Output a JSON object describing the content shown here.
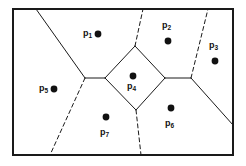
{
  "figure": {
    "kind": "voronoi-diagram",
    "caption": "",
    "frame": {
      "x": 13,
      "y": 9,
      "width": 220,
      "height": 146,
      "stroke_color": "#1a1a1a",
      "stroke_width": 2
    },
    "style": {
      "solid_edge_color": "#1a1a1a",
      "dashed_edge_color": "#1a1a1a",
      "solid_edge_width": 1,
      "dashed_edge_width": 1,
      "dash_pattern": "4 3",
      "site_dot_color": "#111111",
      "site_dot_radius": 3.4,
      "label_color": "#111111",
      "background_color": "#ffffff"
    }
  },
  "chart_data": {
    "type": "scatter",
    "title": "",
    "xlabel": "",
    "ylabel": "",
    "xlim": [
      13,
      233
    ],
    "ylim": [
      9,
      155
    ],
    "grid": false,
    "legend": null,
    "sites": [
      {
        "id": "p1",
        "label": "p",
        "subscript": "1",
        "dot_x": 98,
        "dot_y": 34,
        "label_x": 83,
        "label_y": 29,
        "label_pos": "left"
      },
      {
        "id": "p2",
        "label": "p",
        "subscript": "2",
        "dot_x": 168,
        "dot_y": 41,
        "label_x": 162,
        "label_y": 21,
        "label_pos": "above"
      },
      {
        "id": "p3",
        "label": "p",
        "subscript": "3",
        "dot_x": 215,
        "dot_y": 61,
        "label_x": 209,
        "label_y": 41,
        "label_pos": "above"
      },
      {
        "id": "p4",
        "label": "p",
        "subscript": "4",
        "dot_x": 133,
        "dot_y": 76,
        "label_x": 127,
        "label_y": 82,
        "label_pos": "below"
      },
      {
        "id": "p5",
        "label": "p",
        "subscript": "5",
        "dot_x": 54,
        "dot_y": 89,
        "label_x": 39,
        "label_y": 84,
        "label_pos": "left"
      },
      {
        "id": "p6",
        "label": "p",
        "subscript": "6",
        "dot_x": 171,
        "dot_y": 108,
        "label_x": 165,
        "label_y": 119,
        "label_pos": "below"
      },
      {
        "id": "p7",
        "label": "p",
        "subscript": "7",
        "dot_x": 106,
        "dot_y": 117,
        "label_x": 100,
        "label_y": 128,
        "label_pos": "below"
      }
    ],
    "edges": [
      {
        "id": "e-top-left",
        "style": "solid",
        "points": "36,9 85,78"
      },
      {
        "id": "e-left-vertex",
        "style": "solid",
        "points": "85,78 105,78"
      },
      {
        "id": "e-left-down",
        "style": "dashed",
        "points": "85,78 50,155"
      },
      {
        "id": "e-diamond-ul",
        "style": "solid",
        "points": "105,78 135,46"
      },
      {
        "id": "e-diamond-ur",
        "style": "solid",
        "points": "135,46 165,78"
      },
      {
        "id": "e-diamond-lr",
        "style": "solid",
        "points": "165,78 136,110"
      },
      {
        "id": "e-diamond-ll",
        "style": "solid",
        "points": "136,110 105,78"
      },
      {
        "id": "e-apex-up",
        "style": "dashed",
        "points": "135,46 143,9"
      },
      {
        "id": "e-bottom-down",
        "style": "dashed",
        "points": "136,110 141,155"
      },
      {
        "id": "e-right-mid",
        "style": "solid",
        "points": "165,78 191,78"
      },
      {
        "id": "e-right-up",
        "style": "dashed",
        "points": "191,78 208,9"
      },
      {
        "id": "e-right-down",
        "style": "solid",
        "points": "191,78 233,125"
      }
    ]
  }
}
